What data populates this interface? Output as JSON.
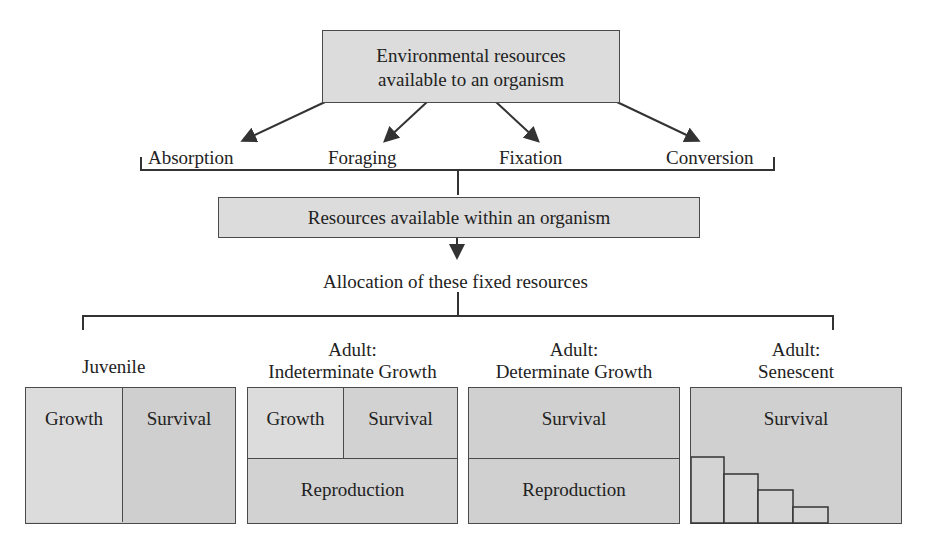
{
  "top_box": {
    "line1": "Environmental resources",
    "line2": "available to an organism"
  },
  "acquisition_modes": [
    {
      "label": "Absorption"
    },
    {
      "label": "Foraging"
    },
    {
      "label": "Fixation"
    },
    {
      "label": "Conversion"
    }
  ],
  "middle_box": {
    "label": "Resources available within an organism"
  },
  "allocation_label": "Allocation of these fixed resources",
  "stages": [
    {
      "title_line1": "",
      "title_line2": "Juvenile",
      "cells": {
        "growth": "Growth",
        "survival": "Survival"
      }
    },
    {
      "title_line1": "Adult:",
      "title_line2": "Indeterminate Growth",
      "cells": {
        "growth": "Growth",
        "survival": "Survival",
        "reproduction": "Reproduction"
      }
    },
    {
      "title_line1": "Adult:",
      "title_line2": "Determinate Growth",
      "cells": {
        "survival": "Survival",
        "reproduction": "Reproduction"
      }
    },
    {
      "title_line1": "Adult:",
      "title_line2": "Senescent",
      "cells": {
        "survival": "Survival",
        "reproduction_steps": 4
      }
    }
  ],
  "colors": {
    "box_fill_light": "#dcdcdc",
    "box_fill_mid": "#cfcfcf",
    "stroke": "#333333"
  }
}
